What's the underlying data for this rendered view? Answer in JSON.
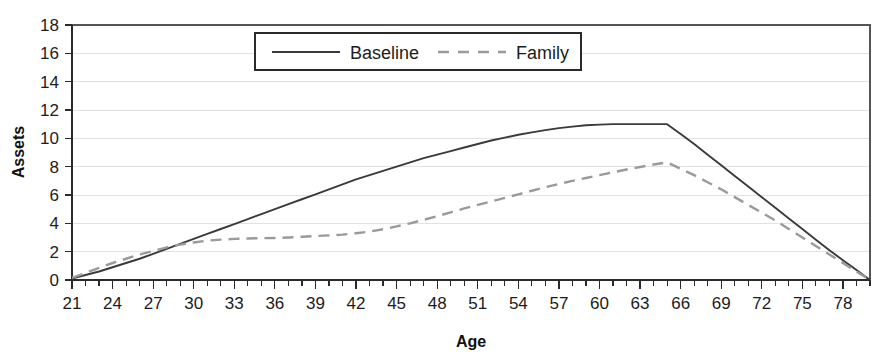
{
  "chart_data": {
    "type": "line",
    "title": "",
    "xlabel": "Age",
    "ylabel": "Assets",
    "xlim": [
      21,
      80
    ],
    "ylim": [
      0,
      18
    ],
    "grid": true,
    "legend_position": "top-center",
    "x_tick_labels": [
      "21",
      "24",
      "27",
      "30",
      "33",
      "36",
      "39",
      "42",
      "45",
      "48",
      "51",
      "54",
      "57",
      "60",
      "63",
      "66",
      "69",
      "72",
      "75",
      "78"
    ],
    "x_tick_values": [
      21,
      24,
      27,
      30,
      33,
      36,
      39,
      42,
      45,
      48,
      51,
      54,
      57,
      60,
      63,
      66,
      69,
      72,
      75,
      78
    ],
    "x_minor_tick_step": 1,
    "y_tick_labels": [
      "0",
      "2",
      "4",
      "6",
      "8",
      "10",
      "12",
      "14",
      "16",
      "18"
    ],
    "y_tick_values": [
      0,
      2,
      4,
      6,
      8,
      10,
      12,
      14,
      16,
      18
    ],
    "x": [
      21,
      22,
      23,
      24,
      25,
      26,
      27,
      28,
      29,
      30,
      31,
      32,
      33,
      34,
      35,
      36,
      37,
      38,
      39,
      40,
      41,
      42,
      43,
      44,
      45,
      46,
      47,
      48,
      49,
      50,
      51,
      52,
      53,
      54,
      55,
      56,
      57,
      58,
      59,
      60,
      61,
      62,
      63,
      64,
      65,
      66,
      67,
      68,
      69,
      70,
      71,
      72,
      73,
      74,
      75,
      76,
      77,
      78,
      79,
      80
    ],
    "series": [
      {
        "name": "Baseline",
        "style": "solid",
        "color": "#3a3a3a",
        "values": [
          0.1,
          0.35,
          0.6,
          0.9,
          1.2,
          1.5,
          1.85,
          2.2,
          2.55,
          2.9,
          3.25,
          3.6,
          3.95,
          4.3,
          4.65,
          5.0,
          5.35,
          5.7,
          6.05,
          6.4,
          6.75,
          7.1,
          7.4,
          7.7,
          8.0,
          8.3,
          8.6,
          8.85,
          9.1,
          9.35,
          9.6,
          9.85,
          10.05,
          10.25,
          10.42,
          10.58,
          10.72,
          10.83,
          10.92,
          10.97,
          11.0,
          11.0,
          11.0,
          11.0,
          11.0,
          10.3,
          9.6,
          8.85,
          8.1,
          7.35,
          6.6,
          5.85,
          5.1,
          4.35,
          3.6,
          2.85,
          2.1,
          1.4,
          0.7,
          0.0
        ]
      },
      {
        "name": "Family",
        "style": "dashed",
        "color": "#9a9a9a",
        "values": [
          0.15,
          0.5,
          0.85,
          1.2,
          1.5,
          1.8,
          2.05,
          2.3,
          2.5,
          2.65,
          2.78,
          2.85,
          2.9,
          2.93,
          2.95,
          2.97,
          3.0,
          3.05,
          3.1,
          3.15,
          3.2,
          3.3,
          3.42,
          3.58,
          3.78,
          4.0,
          4.25,
          4.5,
          4.78,
          5.05,
          5.3,
          5.55,
          5.8,
          6.05,
          6.3,
          6.55,
          6.78,
          7.0,
          7.2,
          7.4,
          7.6,
          7.8,
          7.98,
          8.15,
          8.3,
          7.85,
          7.4,
          6.9,
          6.4,
          5.85,
          5.3,
          4.75,
          4.2,
          3.6,
          3.0,
          2.4,
          1.8,
          1.2,
          0.6,
          0.0
        ]
      }
    ]
  },
  "legend": {
    "items": [
      {
        "label": "Baseline",
        "style": "solid",
        "color": "#3a3a3a"
      },
      {
        "label": "Family",
        "style": "dashed",
        "color": "#9a9a9a"
      }
    ]
  },
  "axes": {
    "y_title": "Assets",
    "x_title": "Age"
  }
}
